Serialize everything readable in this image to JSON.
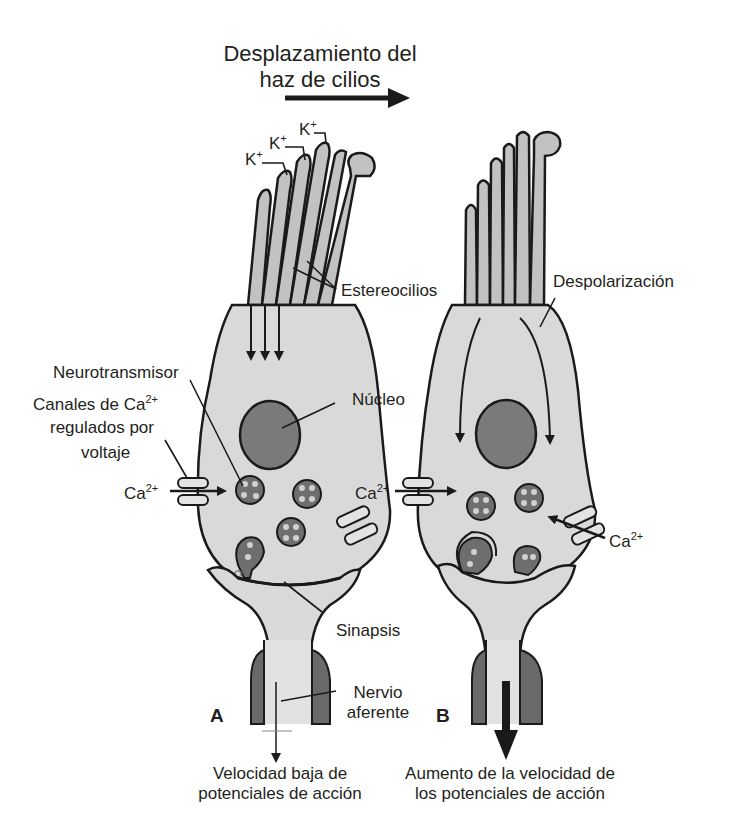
{
  "title": {
    "line1": "Desplazamiento del",
    "line2": "haz de cilios"
  },
  "panel_a": {
    "letter": "A",
    "labels": {
      "k1": "K",
      "k2": "K",
      "k3": "K",
      "k_charge": "+",
      "estereocilios": "Estereocilios",
      "neurotransmisor": "Neurotransmisor",
      "canales_line1": "Canales de Ca",
      "canales_charge": "2+",
      "canales_line2": "regulados por",
      "canales_line3": "voltaje",
      "ca_in": "Ca",
      "ca_charge": "2+",
      "nucleo": "Núcleo",
      "sinapsis": "Sinapsis",
      "nervio_line1": "Nervio",
      "nervio_line2": "aferente"
    },
    "caption_line1": "Velocidad baja de",
    "caption_line2": "potenciales de acción"
  },
  "panel_b": {
    "letter": "B",
    "labels": {
      "despolarizacion": "Despolarización",
      "ca_left": "Ca",
      "ca_left_charge": "2+",
      "ca_right": "Ca",
      "ca_right_charge": "2+"
    },
    "caption_line1": "Aumento de la velocidad de",
    "caption_line2": "los potenciales de acción"
  },
  "colors": {
    "cell_fill": "#d9d9d9",
    "cilia_fill": "#c2c2c2",
    "nucleus_fill": "#7a7a7a",
    "vesicle_fill": "#6e6e6e",
    "nerve_dark": "#6a6a6a",
    "outline": "#1a1a1a",
    "background": "#ffffff"
  }
}
